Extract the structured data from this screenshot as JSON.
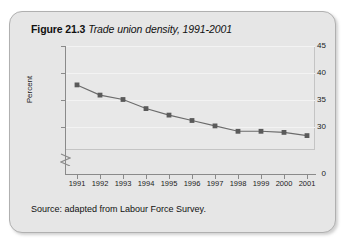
{
  "figure": {
    "number": "Figure 21.3",
    "caption": "Trade union density, 1991-2001",
    "source": "Source: adapted from Labour Force Survey."
  },
  "colors": {
    "panel_background": "#e6e6e6",
    "panel_border": "#b0b0b0",
    "plot_background": "#e8e8e8",
    "plot_border": "#c4c4c4",
    "axis": "#8a8a8a",
    "gridline": "#f3f3f3",
    "series_line": "#6b6b6b",
    "series_marker": "#5a5a5a",
    "text": "#111111"
  },
  "chart_data": {
    "type": "line",
    "title": "Trade union density, 1991-2001",
    "xlabel": "",
    "ylabel": "Percent",
    "categories": [
      "1991",
      "1992",
      "1993",
      "1994",
      "1995",
      "1996",
      "1997",
      "1998",
      "1999",
      "2000",
      "2001"
    ],
    "values": [
      37.8,
      35.9,
      35.1,
      33.4,
      32.2,
      31.2,
      30.2,
      29.2,
      29.2,
      29.0,
      28.4
    ],
    "ylim": [
      28,
      45
    ],
    "y_ticks": [
      "45",
      "40",
      "35",
      "30",
      "0"
    ],
    "y_tick_values": [
      45,
      40,
      35,
      30,
      0
    ],
    "axis_break": true,
    "grid": true,
    "legend": "none",
    "marker": "square"
  }
}
